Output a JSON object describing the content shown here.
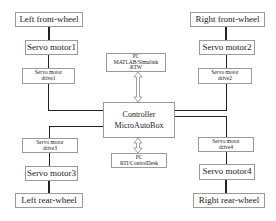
{
  "diagram": {
    "left_front": {
      "wheel": "Left front-wheel",
      "motor": "Servo motor1",
      "drive_line1": "Servo motor",
      "drive_line2": "drive1"
    },
    "right_front": {
      "wheel": "Right front-wheel",
      "motor": "Servo motor2",
      "drive_line1": "Servo motor",
      "drive_line2": "drive2"
    },
    "left_rear": {
      "wheel": "Left rear-wheel",
      "motor": "Servo motor3",
      "drive_line1": "Servo motor",
      "drive_line2": "drive3"
    },
    "right_rear": {
      "wheel": "Right rear-wheel",
      "motor": "Servo motor4",
      "drive_line1": "Servo motor",
      "drive_line2": "drive4"
    },
    "controller": {
      "line1": "Controller",
      "line2": "MicroAutoBox"
    },
    "pc_top": {
      "line1": "PC",
      "line2": "MATLAB/Simulink",
      "line3": "RTW"
    },
    "pc_bottom": {
      "line1": "PC",
      "line2": "RTI/ControlDesk"
    }
  }
}
